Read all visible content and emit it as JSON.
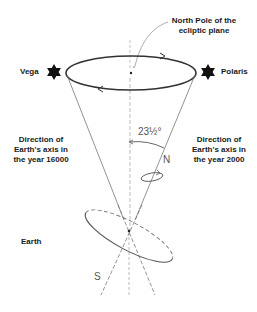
{
  "diagram": {
    "title_label": {
      "line1": "North Pole of the",
      "line2": "ecliptic plane"
    },
    "stars": {
      "left": "Vega",
      "right": "Polaris"
    },
    "directions": {
      "left": {
        "line1": "Direction of",
        "line2": "Earth's axis in",
        "line3": "the year 16000"
      },
      "right": {
        "line1": "Direction of",
        "line2": "Earth's axis in",
        "line3": "the year 2000"
      }
    },
    "angle_label": "23½°",
    "north_label": "N",
    "south_label": "S",
    "earth_label": "Earth",
    "colors": {
      "ink": "#1a1a1a",
      "line": "#777777",
      "ellipse": "#333333"
    }
  }
}
